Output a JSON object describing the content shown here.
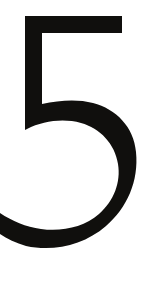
{
  "image": {
    "kind": "single-character-glyph",
    "character": "5",
    "character_name": "digit-five",
    "description": "Large bold black numeral 5 centered on a plain white background",
    "width_px": 147,
    "height_px": 299,
    "orientation": "portrait"
  },
  "colors": {
    "background": "#ffffff",
    "glyph": "#100f0d",
    "glyph_pure_black": "#000000"
  },
  "glyph": {
    "label": "5",
    "style": "geometric-sans-bold",
    "stroke_width_px": 23,
    "stem_width_px": 17,
    "clipped_edges": [
      "left"
    ],
    "bounds": {
      "left_px": 0,
      "top_px": 16,
      "right_px": 137,
      "bottom_px": 249
    },
    "parts": [
      {
        "name": "top-horizontal-bar",
        "x_start_px": 25,
        "x_end_px": 122,
        "y_top_px": 16,
        "y_bottom_px": 33
      },
      {
        "name": "left-vertical-stem",
        "x_start_px": 25,
        "x_end_px": 42,
        "y_top_px": 16,
        "y_bottom_px": 122
      },
      {
        "name": "lower-bowl-arc",
        "x_left_px": 0,
        "x_right_px": 137,
        "y_top_px": 103,
        "y_bottom_px": 249,
        "sweep": "open-upper-left"
      }
    ]
  },
  "outline_path": "M 25 16 L 122 16 L 122 33 L 42 33 L 42 104 C 60 100 78 99 93 103 C 116 109 134 127 136 152 C 139 181 127 208 106 226 C 84 245 54 252 26 246 C 16 243 7 239 0 234 L 0 213 C 12 221 26 227 41 229 C 62 232 84 227 99 214 C 114 201 121 182 118 164 C 115 144 100 128 81 123 C 63 118 43 121 27 129 L 25 130 Z"
}
